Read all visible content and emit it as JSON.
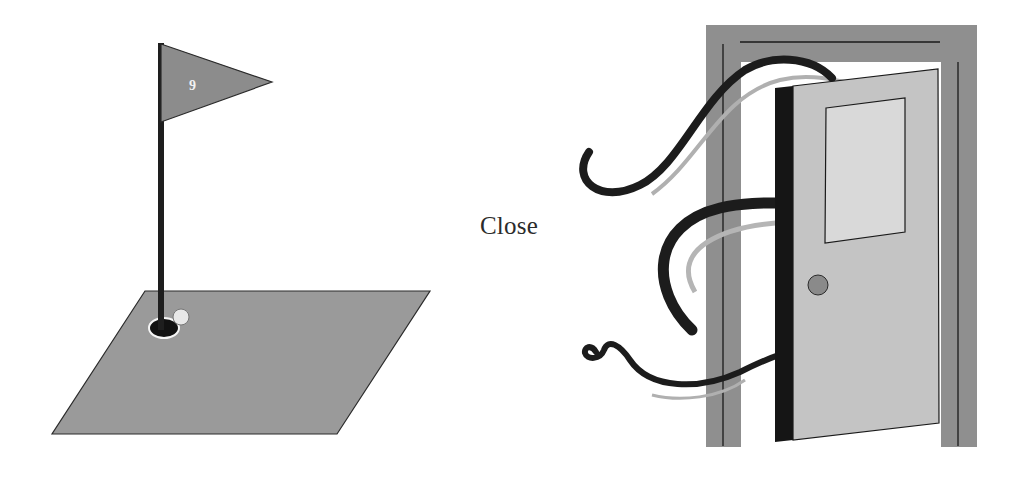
{
  "figure": {
    "label": "Close",
    "left_illustration": {
      "name": "golf-green-with-flag",
      "flag_number": "9"
    },
    "right_illustration": {
      "name": "open-door-with-wind"
    }
  },
  "colors": {
    "green": "#9a9a9a",
    "flag": "#8c8c8c",
    "pole": "#1e1e1e",
    "hole": "#111111",
    "ball": "#e8e8e8",
    "frame": "#8f8f8f",
    "door_panel": "#c4c4c4",
    "door_edge": "#151515",
    "window": "#d9d9d9",
    "knob": "#8a8a8a",
    "wind_dark": "#1c1c1c",
    "wind_light": "#b0b0b0"
  }
}
